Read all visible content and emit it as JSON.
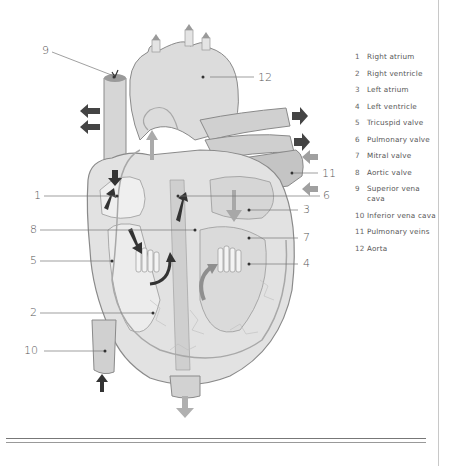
{
  "diagram": {
    "callouts": [
      {
        "number": "1",
        "x": 34,
        "y": 190
      },
      {
        "number": "2",
        "x": 30,
        "y": 306
      },
      {
        "number": "3",
        "x": 303,
        "y": 205
      },
      {
        "number": "4",
        "x": 303,
        "y": 258
      },
      {
        "number": "5",
        "x": 30,
        "y": 255
      },
      {
        "number": "6",
        "x": 323,
        "y": 193
      },
      {
        "number": "7",
        "x": 303,
        "y": 232
      },
      {
        "number": "8",
        "x": 30,
        "y": 225
      },
      {
        "number": "9",
        "x": 42,
        "y": 48
      },
      {
        "number": "10",
        "x": 24,
        "y": 344
      },
      {
        "number": "11",
        "x": 322,
        "y": 170
      },
      {
        "number": "12",
        "x": 258,
        "y": 71
      }
    ]
  },
  "legend": {
    "items": [
      {
        "number": "1",
        "label": "Right atrium"
      },
      {
        "number": "2",
        "label": "Right ventricle"
      },
      {
        "number": "3",
        "label": "Left atrium"
      },
      {
        "number": "4",
        "label": "Left ventricle"
      },
      {
        "number": "5",
        "label": "Tricuspid valve"
      },
      {
        "number": "6",
        "label": "Pulmonary valve"
      },
      {
        "number": "7",
        "label": "Mitral valve"
      },
      {
        "number": "8",
        "label": "Aortic valve"
      },
      {
        "number": "9",
        "label": "Superior vena cava"
      },
      {
        "number": "10",
        "label": "Inferior vena cava"
      },
      {
        "number": "11",
        "label": "Pulmonary veins"
      },
      {
        "number": "12",
        "label": "Aorta"
      }
    ]
  },
  "colors": {
    "tissue": "#d9d9d9",
    "tissue_dark": "#b5b5b5",
    "outline": "#8a8a8a",
    "arrow_dark": "#4a4a4a",
    "arrow_light": "#a9a9a9",
    "text": "#555555"
  }
}
